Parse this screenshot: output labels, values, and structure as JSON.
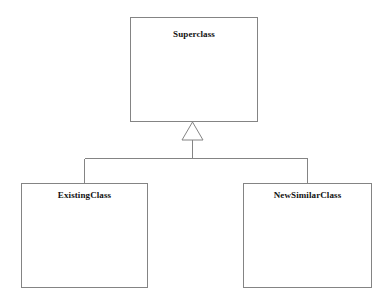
{
  "diagram": {
    "type": "uml-class-diagram",
    "relationship": "generalization",
    "background_color": "#ffffff",
    "line_color": "#848484",
    "fill_color": "#ffffff",
    "text_color": "#121212",
    "classes": [
      {
        "id": "superclass",
        "name": "Superclass",
        "role": "parent"
      },
      {
        "id": "existingclass",
        "name": "ExistingClass",
        "role": "child"
      },
      {
        "id": "newsimilarclass",
        "name": "NewSimilarClass",
        "role": "child"
      }
    ],
    "edges": [
      {
        "from": "ExistingClass",
        "to": "Superclass",
        "kind": "inheritance"
      },
      {
        "from": "NewSimilarClass",
        "to": "Superclass",
        "kind": "inheritance"
      }
    ]
  }
}
